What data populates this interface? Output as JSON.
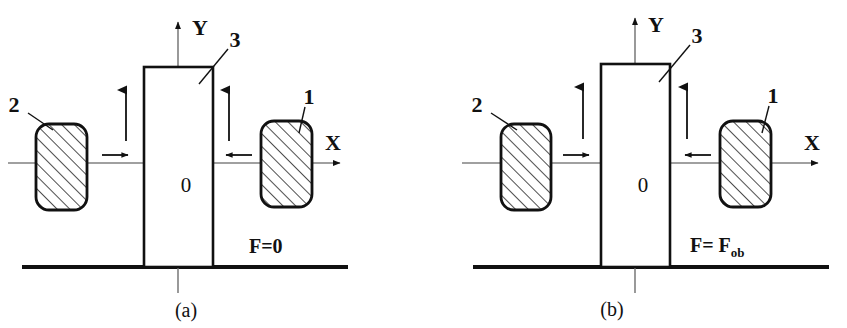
{
  "figure": {
    "colors": {
      "ink": "#111111",
      "axis_gray": "#777777",
      "hatch": "#222222",
      "background": "#ffffff"
    },
    "panels": [
      {
        "id": "a",
        "caption": "(a)",
        "axes": {
          "x_label": "X",
          "y_label": "Y",
          "origin_label": "0"
        },
        "labels": [
          {
            "name": "left-block-callout",
            "text": "2"
          },
          {
            "name": "right-block-callout",
            "text": "1"
          },
          {
            "name": "column-callout",
            "text": "3"
          }
        ],
        "force": {
          "base": "F=0",
          "subscript": ""
        },
        "arrows": [
          {
            "name": "left-horizontal-arrow",
            "direction": "right"
          },
          {
            "name": "right-horizontal-arrow",
            "direction": "left"
          },
          {
            "name": "left-vertical-arrow",
            "direction": "up"
          },
          {
            "name": "right-vertical-arrow",
            "direction": "up"
          }
        ]
      },
      {
        "id": "b",
        "caption": "(b)",
        "axes": {
          "x_label": "X",
          "y_label": "Y",
          "origin_label": "0"
        },
        "labels": [
          {
            "name": "left-block-callout",
            "text": "2"
          },
          {
            "name": "right-block-callout",
            "text": "1"
          },
          {
            "name": "column-callout",
            "text": "3"
          }
        ],
        "force": {
          "base": "F= F",
          "subscript": "ob"
        },
        "arrows": [
          {
            "name": "left-horizontal-arrow",
            "direction": "right"
          },
          {
            "name": "right-horizontal-arrow",
            "direction": "left"
          },
          {
            "name": "left-vertical-arrow",
            "direction": "up"
          },
          {
            "name": "right-vertical-arrow",
            "direction": "up"
          }
        ]
      }
    ]
  }
}
